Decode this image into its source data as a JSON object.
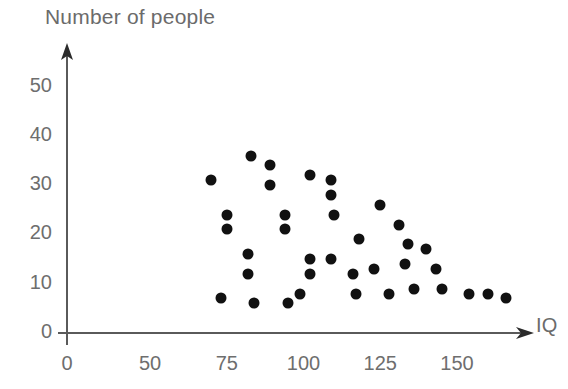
{
  "chart_data": {
    "type": "scatter",
    "title": "",
    "ylabel": "Number of people",
    "xlabel": "IQ",
    "xticks": [
      0,
      50,
      75,
      100,
      125,
      150
    ],
    "yticks": [
      0,
      10,
      20,
      30,
      40,
      50
    ],
    "xlim": [
      0,
      160
    ],
    "ylim": [
      0,
      55
    ],
    "grid": false,
    "legend": null,
    "marker_color": "#111111",
    "axis_color": "#5a5a5a",
    "tick_label_color": "#6e6e6e",
    "points": [
      {
        "x": 70,
        "y": 31
      },
      {
        "x": 83,
        "y": 36
      },
      {
        "x": 89,
        "y": 34
      },
      {
        "x": 89,
        "y": 30
      },
      {
        "x": 75,
        "y": 24
      },
      {
        "x": 75,
        "y": 21
      },
      {
        "x": 82,
        "y": 16
      },
      {
        "x": 82,
        "y": 12
      },
      {
        "x": 73,
        "y": 7
      },
      {
        "x": 84,
        "y": 6
      },
      {
        "x": 102,
        "y": 32
      },
      {
        "x": 109,
        "y": 31
      },
      {
        "x": 109,
        "y": 28
      },
      {
        "x": 110,
        "y": 24
      },
      {
        "x": 94,
        "y": 24
      },
      {
        "x": 94,
        "y": 21
      },
      {
        "x": 125,
        "y": 26
      },
      {
        "x": 118,
        "y": 19
      },
      {
        "x": 102,
        "y": 15
      },
      {
        "x": 109,
        "y": 15
      },
      {
        "x": 102,
        "y": 12
      },
      {
        "x": 116,
        "y": 12
      },
      {
        "x": 123,
        "y": 13
      },
      {
        "x": 99,
        "y": 8
      },
      {
        "x": 95,
        "y": 6
      },
      {
        "x": 117,
        "y": 8
      },
      {
        "x": 131,
        "y": 22
      },
      {
        "x": 134,
        "y": 18
      },
      {
        "x": 140,
        "y": 17
      },
      {
        "x": 133,
        "y": 14
      },
      {
        "x": 143,
        "y": 13
      },
      {
        "x": 128,
        "y": 8
      },
      {
        "x": 136,
        "y": 9
      },
      {
        "x": 145,
        "y": 9
      },
      {
        "x": 154,
        "y": 8
      },
      {
        "x": 160,
        "y": 8
      },
      {
        "x": 166,
        "y": 7
      }
    ]
  }
}
